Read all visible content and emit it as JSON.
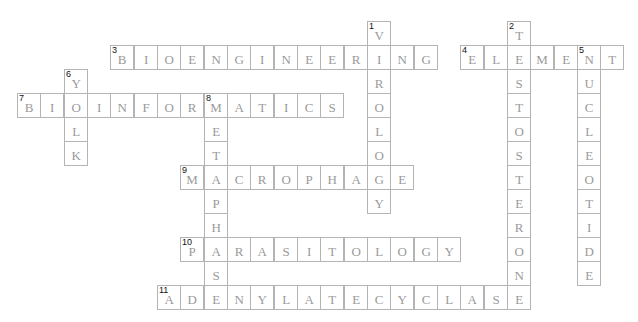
{
  "puzzle": {
    "grid": {
      "origin_x": 17,
      "origin_y": 21,
      "col_pitch": 23.33,
      "row_pitch": 24,
      "cell_w": 24.3,
      "cell_h": 25
    },
    "colors": {
      "border": "#b4b4b4",
      "letter": "#9a9a9a",
      "number": "#111111",
      "background": "#ffffff"
    },
    "words": [
      {
        "number": "1",
        "answer": "VIROLOGY",
        "direction": "down",
        "row": 0,
        "col": 15
      },
      {
        "number": "2",
        "answer": "TESTOSTERONE",
        "direction": "down",
        "row": 0,
        "col": 21
      },
      {
        "number": "3",
        "answer": "BIOENGINEERING",
        "direction": "across",
        "row": 1,
        "col": 4
      },
      {
        "number": "4",
        "answer": "ELEMENT",
        "direction": "across",
        "row": 1,
        "col": 19
      },
      {
        "number": "5",
        "answer": "NUCLEOTIDE",
        "direction": "down",
        "row": 1,
        "col": 24
      },
      {
        "number": "6",
        "answer": "YOLK",
        "direction": "down",
        "row": 2,
        "col": 2
      },
      {
        "number": "7",
        "answer": "BIOINFORMATICS",
        "direction": "across",
        "row": 3,
        "col": 0
      },
      {
        "number": "8",
        "answer": "METAPHASE",
        "direction": "down",
        "row": 3,
        "col": 8
      },
      {
        "number": "9",
        "answer": "MACROPHAGE",
        "direction": "across",
        "row": 6,
        "col": 7
      },
      {
        "number": "10",
        "answer": "PARASITOLOGY",
        "direction": "across",
        "row": 9,
        "col": 7
      },
      {
        "number": "11",
        "answer": "ADENYLATECYCLASE",
        "direction": "across",
        "row": 11,
        "col": 6
      }
    ]
  }
}
